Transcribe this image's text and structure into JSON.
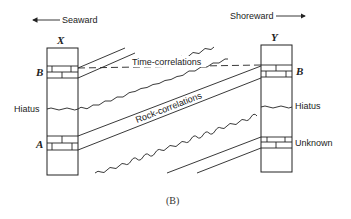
{
  "directions": {
    "left": "Seaward",
    "right": "Shoreward"
  },
  "columns": {
    "left": {
      "name": "X",
      "bed_upper": "B",
      "middle": "Hiatus",
      "bed_lower": "A"
    },
    "right": {
      "name": "Y",
      "bed_upper": "B",
      "middle": "Hiatus",
      "bed_lower": "Unknown"
    }
  },
  "correlations": {
    "time": "Time-correlations",
    "rock": "Rock-correlations"
  },
  "caption": "(B)",
  "colors": {
    "ink": "#222222",
    "background": "#ffffff"
  }
}
